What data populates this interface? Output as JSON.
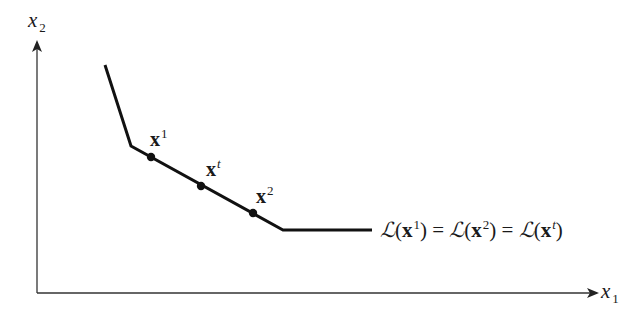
{
  "diagram": {
    "type": "indifference-curve",
    "axes": {
      "x_label": {
        "base": "x",
        "subscript": "1"
      },
      "y_label": {
        "base": "x",
        "subscript": "2"
      }
    },
    "curve": {
      "vertices": [
        [
          105,
          65
        ],
        [
          131,
          146
        ],
        [
          283,
          230
        ],
        [
          372,
          230
        ]
      ],
      "color": "#111111"
    },
    "points": [
      {
        "id": "x1",
        "base": "x",
        "superscript": "1",
        "pos": [
          151,
          157
        ]
      },
      {
        "id": "xt",
        "base": "x",
        "superscript": "t",
        "pos": [
          201,
          186
        ]
      },
      {
        "id": "x2",
        "base": "x",
        "superscript": "2",
        "pos": [
          253,
          213
        ]
      }
    ],
    "equation": {
      "script_L": "ℒ",
      "terms": [
        {
          "base": "x",
          "superscript": "1"
        },
        {
          "base": "x",
          "superscript": "2"
        },
        {
          "base": "x",
          "superscript": "t"
        }
      ],
      "equals": "="
    }
  }
}
